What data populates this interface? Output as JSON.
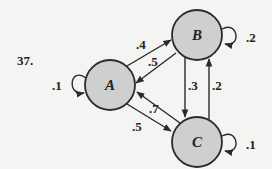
{
  "problem_number": "37.",
  "colors": {
    "background": "#f4f4f2",
    "node_fill": "#cfcfcf",
    "stroke": "#2a2a2a",
    "text": "#222222"
  },
  "nodes": [
    {
      "id": "A",
      "label": "A",
      "cx": 110,
      "cy": 85,
      "r": 25
    },
    {
      "id": "B",
      "label": "B",
      "cx": 197,
      "cy": 35,
      "r": 25
    },
    {
      "id": "C",
      "label": "C",
      "cx": 197,
      "cy": 142,
      "r": 25
    }
  ],
  "edges": [
    {
      "from": "A",
      "to": "B",
      "label": ".4"
    },
    {
      "from": "B",
      "to": "A",
      "label": ".5"
    },
    {
      "from": "B",
      "to": "C",
      "label": ".3"
    },
    {
      "from": "C",
      "to": "B",
      "label": ".2"
    },
    {
      "from": "C",
      "to": "A",
      "label": ".7"
    },
    {
      "from": "A",
      "to": "C",
      "label": ".5"
    }
  ],
  "self_loops": [
    {
      "node": "A",
      "label": ".1"
    },
    {
      "node": "B",
      "label": ".2"
    },
    {
      "node": "C",
      "label": ".1"
    }
  ],
  "labels": {
    "node_a": "A",
    "node_b": "B",
    "node_c": "C",
    "edge_ab": ".4",
    "edge_ba": ".5",
    "edge_bc": ".3",
    "edge_cb": ".2",
    "edge_ca": ".7",
    "edge_ac": ".5",
    "loop_a": ".1",
    "loop_b": ".2",
    "loop_c": ".1"
  }
}
